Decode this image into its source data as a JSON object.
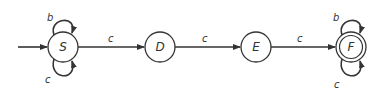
{
  "diagram": {
    "type": "finite-automaton",
    "states": [
      {
        "id": "S",
        "label": "S",
        "start": true,
        "accepting": false
      },
      {
        "id": "D",
        "label": "D",
        "start": false,
        "accepting": false
      },
      {
        "id": "E",
        "label": "E",
        "start": false,
        "accepting": false
      },
      {
        "id": "F",
        "label": "F",
        "start": false,
        "accepting": true
      }
    ],
    "transitions": [
      {
        "from": "S",
        "to": "S",
        "label": "b",
        "position": "top-loop"
      },
      {
        "from": "S",
        "to": "S",
        "label": "c",
        "position": "bottom-loop"
      },
      {
        "from": "S",
        "to": "D",
        "label": "c"
      },
      {
        "from": "D",
        "to": "E",
        "label": "c"
      },
      {
        "from": "E",
        "to": "F",
        "label": "c"
      },
      {
        "from": "F",
        "to": "F",
        "label": "b",
        "position": "top-loop"
      },
      {
        "from": "F",
        "to": "F",
        "label": "c",
        "position": "bottom-loop"
      }
    ]
  },
  "labels": {
    "S": "S",
    "D": "D",
    "E": "E",
    "F": "F",
    "s_loop_top": "b",
    "s_loop_bottom": "c",
    "s_to_d": "c",
    "d_to_e": "c",
    "e_to_f": "c",
    "f_loop_top": "b",
    "f_loop_bottom": "c"
  }
}
